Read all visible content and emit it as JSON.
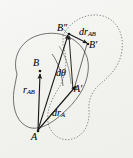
{
  "figure": {
    "background_color": "#f2f2ef",
    "ink_color": "#1a1a1a",
    "points": [
      {
        "id": "A",
        "label": "A",
        "x": 38,
        "y": 131,
        "body": "initial"
      },
      {
        "id": "B",
        "label": "B",
        "x": 40,
        "y": 72,
        "body": "initial"
      },
      {
        "id": "Ap",
        "label": "A'",
        "x": 72,
        "y": 91,
        "body": "displaced"
      },
      {
        "id": "Bp",
        "label": "B'",
        "x": 88,
        "y": 44,
        "body": "displaced"
      },
      {
        "id": "B2",
        "label": "B″",
        "x": 68,
        "y": 32,
        "body": "intermediate"
      }
    ],
    "vectors": [
      {
        "id": "r_AB",
        "label_main": "r",
        "label_sub": "AB",
        "from": "A",
        "to": "B"
      },
      {
        "id": "dr_A",
        "label_main": "dr",
        "label_sub": "A",
        "from": "A",
        "to": "Ap"
      },
      {
        "id": "dr_AB",
        "label_main": "dr",
        "label_sub": "AB",
        "from": "B″",
        "to": "B'"
      },
      {
        "id": "A_to_B2",
        "label_main": "",
        "label_sub": "",
        "from": "A",
        "to": "B″"
      },
      {
        "id": "Ap_to_B2",
        "label_main": "",
        "label_sub": "",
        "from": "A'",
        "to": "B″"
      }
    ],
    "angle": {
      "id": "d_theta",
      "label_main": "d",
      "label_symbol": "θ",
      "between": [
        "A-B",
        "A-B″"
      ]
    },
    "bodies": [
      {
        "id": "initial-body",
        "style": "solid",
        "description": "original rigid body outline"
      },
      {
        "id": "displaced-body",
        "style": "dotted",
        "description": "displaced rigid body outline"
      }
    ],
    "labels": {
      "B_double_prime": "B″",
      "dr_AB_main": "dr",
      "dr_AB_sub": "AB",
      "B_prime": "B'",
      "B": "B",
      "d_theta": "dθ",
      "A_prime": "A'",
      "r_AB_main": "r",
      "r_AB_sub": "AB",
      "dr_A_main": "dr",
      "dr_A_sub": "A",
      "A": "A"
    }
  }
}
